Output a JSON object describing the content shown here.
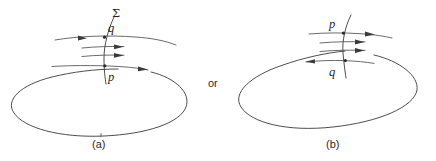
{
  "figure": {
    "kind": "geometry-diagram",
    "background_color": "#ffffff",
    "line_color": "#3a3a3a",
    "text_color": "#1f1f1f",
    "connector": {
      "text": "or"
    },
    "panels": [
      {
        "id": "a",
        "caption": "(a)",
        "surface_label": "Σ",
        "points": [
          {
            "name": "q",
            "label": "q",
            "position": "upper-crossing"
          },
          {
            "name": "p",
            "label": "p",
            "position": "lower-crossing"
          }
        ],
        "arrow_directions": [
          "right",
          "right",
          "right",
          "right"
        ],
        "arrow_count": 4
      },
      {
        "id": "b",
        "caption": "(b)",
        "surface_label": "",
        "points": [
          {
            "name": "p",
            "label": "p",
            "position": "upper-crossing"
          },
          {
            "name": "q",
            "label": "q",
            "position": "lower-crossing"
          }
        ],
        "arrow_directions": [
          "right",
          "right",
          "right",
          "left"
        ],
        "arrow_count": 4
      }
    ]
  }
}
